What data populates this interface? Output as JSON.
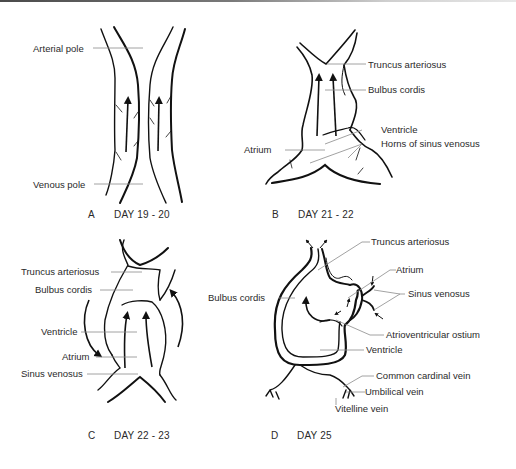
{
  "figure": {
    "panels": [
      {
        "id": "A",
        "letter": "A",
        "caption": "DAY 19 - 20",
        "labels": [
          "Arterial pole",
          "Venous pole"
        ]
      },
      {
        "id": "B",
        "letter": "B",
        "caption": "DAY 21 - 22",
        "labels": [
          "Truncus arteriosus",
          "Bulbus cordis",
          "Ventricle",
          "Atrium",
          "Horns of sinus venosus"
        ]
      },
      {
        "id": "C",
        "letter": "C",
        "caption": "DAY 22 - 23",
        "labels": [
          "Truncus arteriosus",
          "Bulbus cordis",
          "Ventricle",
          "Atrium",
          "Sinus venosus"
        ]
      },
      {
        "id": "D",
        "letter": "D",
        "caption": "DAY 25",
        "labels": [
          "Truncus arteriosus",
          "Atrium",
          "Sinus venosus",
          "Bulbus cordis",
          "Atrioventricular ostium",
          "Ventricle",
          "Common cardinal vein",
          "Umbilical vein",
          "Vitelline vein"
        ]
      }
    ],
    "icons": [
      "blood-flow-arrow-icon"
    ],
    "colors": {
      "line": "#111111",
      "leader": "#8a8a8a",
      "text": "#2a2a2a",
      "background": "#ffffff"
    }
  }
}
